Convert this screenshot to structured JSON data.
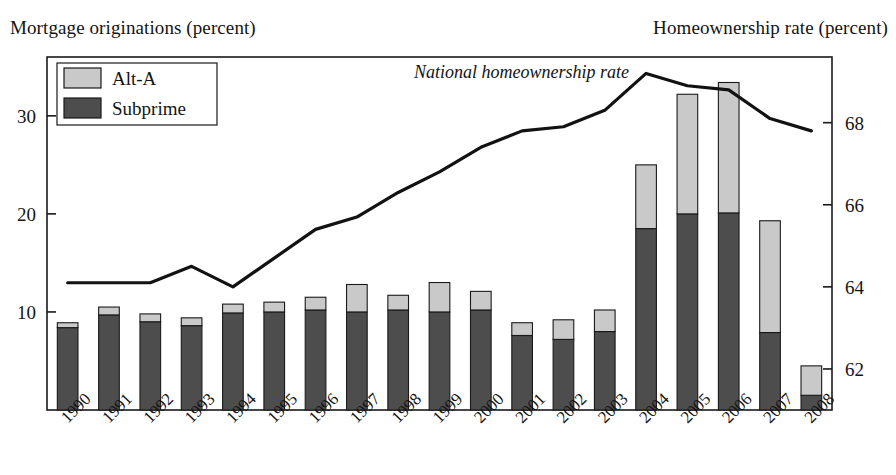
{
  "figure": {
    "left_axis_caption": "Mortgage originations (percent)",
    "right_axis_caption": "Homeownership rate (percent)",
    "line_annotation": "National homeownership rate"
  },
  "legend": {
    "items": [
      {
        "label": "Alt-A",
        "color": "#c9c9c9"
      },
      {
        "label": "Subprime",
        "color": "#4d4d4d"
      }
    ]
  },
  "colors": {
    "alt_a": "#c9c9c9",
    "subprime": "#4d4d4d",
    "line": "#121212",
    "axis": "#191919",
    "background": "#ffffff"
  },
  "chart_data": {
    "type": "bar",
    "title": "",
    "subtitle": "",
    "xlabel": "",
    "ylabel": "Mortgage originations (percent)",
    "y2label": "Homeownership rate (percent)",
    "grid": false,
    "legend_position": "top-left",
    "categories": [
      "1990",
      "1991",
      "1992",
      "1993",
      "1994",
      "1995",
      "1996",
      "1997",
      "1998",
      "1999",
      "2000",
      "2001",
      "2002",
      "2003",
      "2004",
      "2005",
      "2006",
      "2007",
      "2008"
    ],
    "ylim": [
      0,
      36
    ],
    "yticks": [
      10,
      20,
      30
    ],
    "y2lim": [
      61,
      69.6
    ],
    "y2ticks": [
      62,
      64,
      66,
      68
    ],
    "series": [
      {
        "name": "Subprime",
        "axis": "left",
        "kind": "bar-stacked",
        "color": "#4d4d4d",
        "values": [
          8.4,
          9.7,
          9.0,
          8.6,
          9.9,
          10.0,
          10.2,
          10.0,
          10.2,
          10.0,
          10.2,
          7.6,
          7.2,
          8.0,
          18.5,
          20.0,
          20.1,
          7.9,
          1.5
        ]
      },
      {
        "name": "Alt-A",
        "axis": "left",
        "kind": "bar-stacked",
        "color": "#c9c9c9",
        "values": [
          0.5,
          0.8,
          0.8,
          0.8,
          0.9,
          1.0,
          1.3,
          2.8,
          1.5,
          3.0,
          1.9,
          1.3,
          2.0,
          2.2,
          6.5,
          12.2,
          13.3,
          11.4,
          3.0
        ]
      },
      {
        "name": "National homeownership rate",
        "axis": "right",
        "kind": "line",
        "color": "#121212",
        "values": [
          64.1,
          64.1,
          64.1,
          64.5,
          64.0,
          64.7,
          65.4,
          65.7,
          66.3,
          66.8,
          67.4,
          67.8,
          67.9,
          68.3,
          69.2,
          68.9,
          68.8,
          68.1,
          67.8
        ]
      }
    ],
    "totals": [
      8.9,
      10.5,
      9.8,
      9.4,
      10.8,
      11.0,
      11.5,
      12.8,
      11.7,
      13.0,
      12.1,
      8.9,
      9.2,
      10.2,
      25.0,
      32.2,
      33.4,
      19.3,
      4.5
    ]
  }
}
